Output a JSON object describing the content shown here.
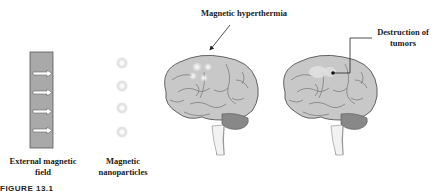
{
  "figure": {
    "caption": "FIGURE 13.1",
    "panels": [
      {
        "id": "magnet",
        "label_line1": "External magnetic",
        "label_line2": "field",
        "arrow_count": 4
      },
      {
        "id": "nanoparticles",
        "label_line1": "Magnetic",
        "label_line2": "nanoparticles",
        "particle_count": 4
      },
      {
        "id": "brain-hyperthermia",
        "label": "Magnetic hyperthermia"
      },
      {
        "id": "brain-destruction",
        "label_line1": "Destruction of",
        "label_line2": "tumors"
      }
    ]
  },
  "colors": {
    "magnet_fill": "#a9a9a9",
    "brain_fill": "#c8c8c8",
    "outline": "#555555",
    "text": "#222222"
  }
}
